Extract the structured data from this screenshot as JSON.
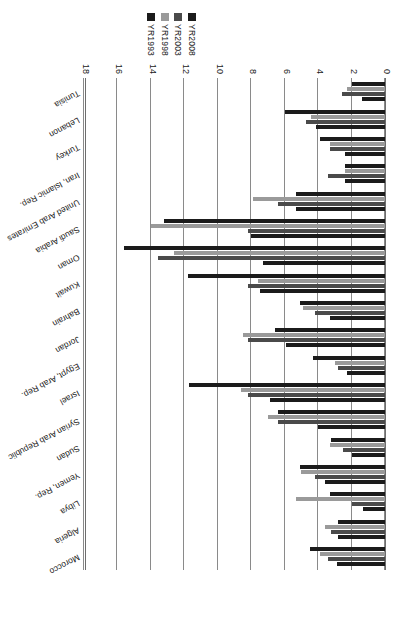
{
  "chart_data": {
    "type": "bar",
    "orientation": "horizontal",
    "title": "",
    "subtitle": "",
    "xlabel": "",
    "ylabel": "",
    "xlim": [
      0,
      18
    ],
    "xticks": [
      0,
      2,
      4,
      6,
      8,
      10,
      12,
      14,
      16,
      18
    ],
    "grid": true,
    "legend_position": "top-right",
    "categories": [
      "Morocco",
      "Algeria",
      "Libya",
      "Yemen, Rep.",
      "Sudan",
      "Syrian Arab Republic",
      "Israel",
      "Egypt, Arab Rep.",
      "Jordan",
      "Bahrain",
      "Kuwait",
      "Oman",
      "Saudi Arabia",
      "United Arab Emirates",
      "Iran, Islamic Rep.",
      "Turkey",
      "Lebanon",
      "Tunisia"
    ],
    "series": [
      {
        "name": "YR1993",
        "color": "#1b1b1b",
        "values": [
          4.5,
          2.8,
          3.3,
          5.1,
          3.2,
          6.4,
          11.7,
          4.3,
          6.6,
          5.1,
          11.8,
          15.6,
          13.2,
          5.3,
          2.4,
          3.9,
          6.0,
          2.0
        ]
      },
      {
        "name": "YR1998",
        "color": "#9a9a9a",
        "values": [
          3.9,
          3.6,
          5.3,
          5.0,
          3.3,
          7.0,
          8.6,
          3.0,
          8.5,
          4.9,
          7.6,
          12.6,
          14.0,
          7.9,
          2.4,
          3.3,
          4.4,
          2.3
        ]
      },
      {
        "name": "YR2003",
        "color": "#4a4a4a",
        "values": [
          3.4,
          3.2,
          2.0,
          4.2,
          2.5,
          6.4,
          8.2,
          2.8,
          8.2,
          4.2,
          8.2,
          13.6,
          8.2,
          6.4,
          3.4,
          3.3,
          4.7,
          2.6
        ]
      },
      {
        "name": "YR2008",
        "color": "#1b1b1b",
        "values": [
          2.9,
          2.8,
          1.3,
          3.6,
          2.0,
          4.0,
          6.9,
          2.3,
          5.9,
          3.3,
          7.5,
          7.3,
          8.0,
          5.3,
          2.4,
          2.4,
          4.1,
          1.4
        ]
      }
    ]
  },
  "legend": {
    "entries": [
      {
        "label": "YR1993",
        "color": "#1b1b1b"
      },
      {
        "label": "YR1998",
        "color": "#9a9a9a"
      },
      {
        "label": "YR2003",
        "color": "#4a4a4a"
      },
      {
        "label": "YR2008",
        "color": "#1b1b1b"
      }
    ]
  },
  "axis": {
    "ticks": [
      "18",
      "16",
      "14",
      "12",
      "10",
      "8",
      "6",
      "4",
      "2",
      "0"
    ]
  }
}
